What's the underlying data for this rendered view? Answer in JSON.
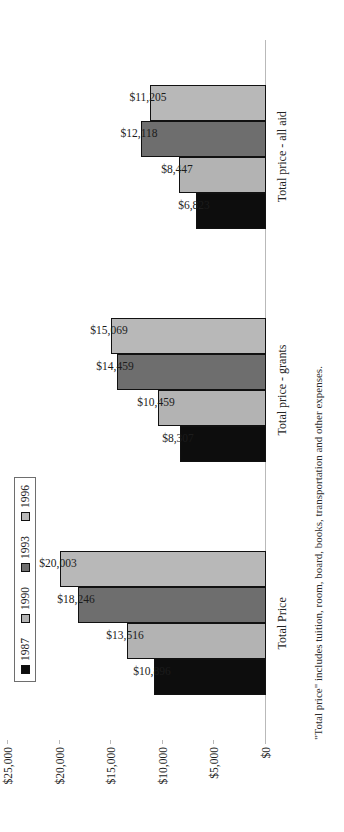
{
  "chart_data": {
    "type": "bar",
    "title": "",
    "xlabel": "",
    "ylabel": "",
    "ylim": [
      0,
      25000
    ],
    "grid": false,
    "legend_position": "top-left",
    "categories": [
      "Total Price",
      "Total price - grants",
      "Total price - all aid"
    ],
    "tick_labels": [
      "$25,000",
      "$20,000",
      "$15,000",
      "$10,000",
      "$5,000",
      "$0"
    ],
    "tick_values": [
      25000,
      20000,
      15000,
      10000,
      5000,
      0
    ],
    "series": [
      {
        "name": "1987",
        "color": "#0d0d0d",
        "values": [
          10896,
          8307,
          6823
        ]
      },
      {
        "name": "1990",
        "color": "#b3b3b3",
        "values": [
          13516,
          10459,
          8447
        ]
      },
      {
        "name": "1993",
        "color": "#6e6e6e",
        "values": [
          18246,
          14459,
          12118
        ]
      },
      {
        "name": "1996",
        "color": "#b8b8b8",
        "values": [
          20003,
          15069,
          11205
        ]
      }
    ],
    "data_labels": [
      [
        "$10,896",
        "$13,516",
        "$18,246",
        "$20,003"
      ],
      [
        "$8,307",
        "$10,459",
        "$14,459",
        "$15,069"
      ],
      [
        "$6,823",
        "$8,447",
        "$12,118",
        "$11,205"
      ]
    ],
    "footnote": "\"Total price\" includes tuition, room, board, books, transportation and other expenses."
  }
}
